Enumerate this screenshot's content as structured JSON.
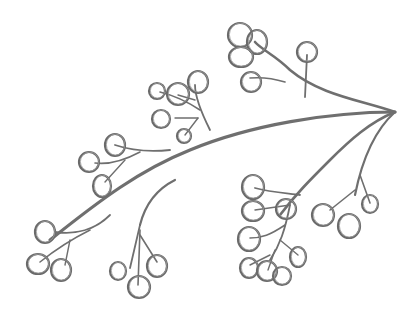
{
  "image": {
    "subject": "pencil sketch of a berry branch",
    "width": 397,
    "height": 317,
    "background": "#ffffff",
    "stroke_color": "#6a6a6a"
  },
  "stems": [
    {
      "d": "M395 112 C330 112 250 125 190 150 C140 170 100 200 50 240",
      "w": 3.2
    },
    {
      "d": "M395 112 C360 100 320 95 290 70 C275 55 262 50 255 42",
      "w": 2.6
    },
    {
      "d": "M305 97 L307 55",
      "w": 1.8
    },
    {
      "d": "M285 82 C272 78 262 77 250 78",
      "w": 1.6
    },
    {
      "d": "M395 112 C370 122 350 140 330 160 C310 180 295 195 280 215",
      "w": 2.6
    },
    {
      "d": "M395 112 C375 130 362 160 355 195",
      "w": 2.2
    },
    {
      "d": "M360 175 L370 203",
      "w": 1.6
    },
    {
      "d": "M355 190 L330 210",
      "w": 1.6
    },
    {
      "d": "M300 195 C285 193 270 192 255 188",
      "w": 1.8
    },
    {
      "d": "M290 205 L255 210",
      "w": 1.4
    },
    {
      "d": "M290 205 C285 230 280 245 270 260",
      "w": 1.8
    },
    {
      "d": "M285 225 C270 235 262 238 250 238",
      "w": 1.6
    },
    {
      "d": "M280 240 L298 255",
      "w": 1.4
    },
    {
      "d": "M270 255 L250 265",
      "w": 1.4
    },
    {
      "d": "M275 250 L268 270",
      "w": 1.4
    },
    {
      "d": "M210 130 C200 110 195 95 195 85",
      "w": 1.8
    },
    {
      "d": "M200 110 C185 100 172 95 160 92",
      "w": 1.6
    },
    {
      "d": "M198 118 L175 118",
      "w": 1.4
    },
    {
      "d": "M198 118 L185 135",
      "w": 1.4
    },
    {
      "d": "M195 100 L178 95",
      "w": 1.4
    },
    {
      "d": "M170 150 C150 152 130 150 115 145",
      "w": 1.8
    },
    {
      "d": "M140 152 C125 160 110 165 95 163",
      "w": 1.6
    },
    {
      "d": "M125 160 L105 182",
      "w": 1.4
    },
    {
      "d": "M175 180 C155 190 145 205 140 225",
      "w": 2.2
    },
    {
      "d": "M140 225 L130 268",
      "w": 1.8
    },
    {
      "d": "M140 230 L138 285",
      "w": 1.6
    },
    {
      "d": "M140 235 L157 262",
      "w": 1.6
    },
    {
      "d": "M110 215 C95 230 75 235 55 232",
      "w": 1.8
    },
    {
      "d": "M90 230 C70 240 55 250 40 262",
      "w": 1.6
    },
    {
      "d": "M70 240 L65 265",
      "w": 1.4
    }
  ],
  "berries": [
    {
      "cx": 240,
      "cy": 35,
      "rx": 12,
      "ry": 12
    },
    {
      "cx": 257,
      "cy": 42,
      "rx": 10,
      "ry": 12
    },
    {
      "cx": 241,
      "cy": 57,
      "rx": 12,
      "ry": 10
    },
    {
      "cx": 307,
      "cy": 52,
      "rx": 10,
      "ry": 10
    },
    {
      "cx": 251,
      "cy": 82,
      "rx": 10,
      "ry": 10
    },
    {
      "cx": 198,
      "cy": 82,
      "rx": 10,
      "ry": 11
    },
    {
      "cx": 178,
      "cy": 94,
      "rx": 11,
      "ry": 11
    },
    {
      "cx": 157,
      "cy": 91,
      "rx": 8,
      "ry": 8
    },
    {
      "cx": 161,
      "cy": 119,
      "rx": 9,
      "ry": 9
    },
    {
      "cx": 184,
      "cy": 136,
      "rx": 7,
      "ry": 7
    },
    {
      "cx": 115,
      "cy": 145,
      "rx": 10,
      "ry": 11
    },
    {
      "cx": 89,
      "cy": 162,
      "rx": 10,
      "ry": 10
    },
    {
      "cx": 102,
      "cy": 186,
      "rx": 9,
      "ry": 11
    },
    {
      "cx": 45,
      "cy": 232,
      "rx": 10,
      "ry": 11
    },
    {
      "cx": 38,
      "cy": 264,
      "rx": 11,
      "ry": 10
    },
    {
      "cx": 61,
      "cy": 270,
      "rx": 10,
      "ry": 11
    },
    {
      "cx": 118,
      "cy": 271,
      "rx": 8,
      "ry": 9
    },
    {
      "cx": 139,
      "cy": 287,
      "rx": 11,
      "ry": 11
    },
    {
      "cx": 157,
      "cy": 266,
      "rx": 10,
      "ry": 11
    },
    {
      "cx": 253,
      "cy": 187,
      "rx": 11,
      "ry": 12
    },
    {
      "cx": 253,
      "cy": 211,
      "rx": 11,
      "ry": 10
    },
    {
      "cx": 286,
      "cy": 209,
      "rx": 10,
      "ry": 10
    },
    {
      "cx": 249,
      "cy": 239,
      "rx": 11,
      "ry": 12
    },
    {
      "cx": 298,
      "cy": 257,
      "rx": 8,
      "ry": 10
    },
    {
      "cx": 249,
      "cy": 268,
      "rx": 9,
      "ry": 10
    },
    {
      "cx": 267,
      "cy": 271,
      "rx": 10,
      "ry": 10
    },
    {
      "cx": 282,
      "cy": 276,
      "rx": 9,
      "ry": 9
    },
    {
      "cx": 323,
      "cy": 215,
      "rx": 11,
      "ry": 11
    },
    {
      "cx": 349,
      "cy": 226,
      "rx": 11,
      "ry": 12
    },
    {
      "cx": 370,
      "cy": 204,
      "rx": 8,
      "ry": 9
    }
  ]
}
